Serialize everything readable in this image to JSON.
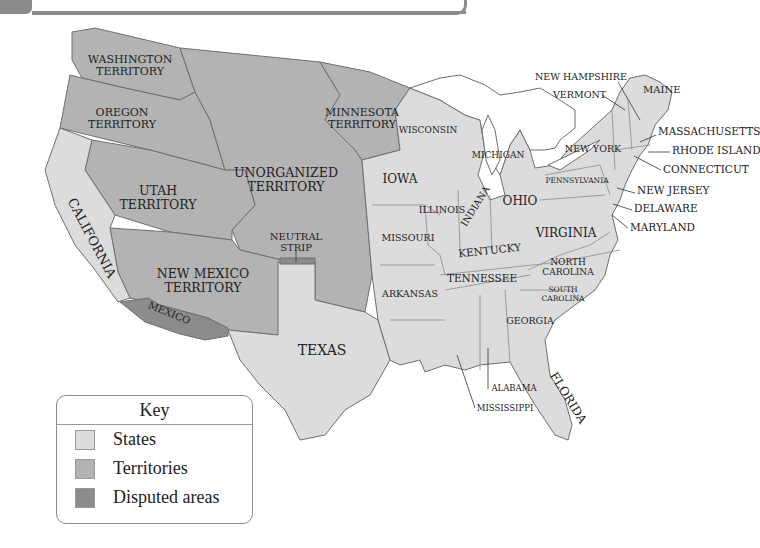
{
  "colors": {
    "states": "#dcdcdc",
    "territories": "#b3b3b3",
    "disputed": "#8c8c8c",
    "border": "#6e6e6e",
    "water": "#ffffff"
  },
  "regions": {
    "territories": {
      "washington": [
        "WASHINGTON",
        "TERRITORY"
      ],
      "oregon": [
        "OREGON",
        "TERRITORY"
      ],
      "minnesota": [
        "MINNESOTA",
        "TERRITORY"
      ],
      "unorganized": [
        "UNORGANIZED",
        "TERRITORY"
      ],
      "utah": [
        "UTAH",
        "TERRITORY"
      ],
      "new_mexico": [
        "NEW MEXICO",
        "TERRITORY"
      ]
    },
    "disputed": {
      "neutral_strip": [
        "NEUTRAL",
        "STRIP"
      ],
      "mexico": "MEXICO"
    },
    "states": {
      "california": "CALIFORNIA",
      "texas": "TEXAS",
      "iowa": "IOWA",
      "wisconsin": "WISCONSIN",
      "michigan": "MICHIGAN",
      "illinois": "ILLINOIS",
      "indiana": "INDIANA",
      "ohio": "OHIO",
      "missouri": "MISSOURI",
      "arkansas": "ARKANSAS",
      "kentucky": "KENTUCKY",
      "tennessee": "TENNESSEE",
      "virginia": "VIRGINIA",
      "north_carolina": [
        "NORTH",
        "CAROLINA"
      ],
      "south_carolina": [
        "SOUTH",
        "CAROLINA"
      ],
      "georgia": "GEORGIA",
      "florida": "FLORIDA",
      "alabama": "ALABAMA",
      "mississippi": "MISSISSIPPI",
      "pennsylvania": "PENNSYLVANIA",
      "new_york": "NEW YORK",
      "new_hampshire": "NEW HAMPSHIRE",
      "vermont": "VERMONT",
      "maine": "MAINE",
      "massachusetts": "MASSACHUSETTS",
      "rhode_island": "RHODE ISLAND",
      "connecticut": "CONNECTICUT",
      "new_jersey": "NEW JERSEY",
      "delaware": "DELAWARE",
      "maryland": "MARYLAND"
    }
  },
  "key": {
    "title": "Key",
    "items": [
      {
        "label": "States",
        "color": "#dcdcdc"
      },
      {
        "label": "Territories",
        "color": "#b3b3b3"
      },
      {
        "label": "Disputed areas",
        "color": "#8c8c8c"
      }
    ]
  }
}
